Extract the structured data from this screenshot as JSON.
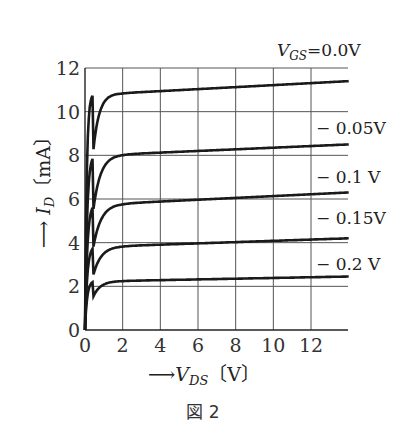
{
  "chart_data": {
    "type": "line",
    "title": "",
    "xlabel": "V_DS [V]",
    "ylabel": "I_D [mA]",
    "xlim": [
      0,
      14
    ],
    "ylim": [
      0,
      12
    ],
    "x_ticks": [
      0,
      2,
      4,
      6,
      8,
      10,
      12
    ],
    "y_ticks": [
      0,
      2,
      4,
      6,
      8,
      10,
      12
    ],
    "grid": true,
    "legend_position": "inline-right",
    "series": [
      {
        "name": "V_GS = 0.0V",
        "label": "VGS = 0.0V",
        "x": [
          0,
          0.3,
          0.5,
          1,
          2,
          4,
          8,
          14
        ],
        "values": [
          0,
          8.5,
          10.0,
          10.6,
          10.85,
          10.95,
          11.1,
          11.4
        ]
      },
      {
        "name": "-0.05V",
        "label": "− 0.05V",
        "x": [
          0,
          0.3,
          0.5,
          1,
          2,
          4,
          8,
          14
        ],
        "values": [
          0,
          6.0,
          7.4,
          7.9,
          8.05,
          8.1,
          8.25,
          8.5
        ]
      },
      {
        "name": "-0.1 V",
        "label": "− 0.1  V",
        "x": [
          0,
          0.3,
          0.5,
          1,
          2,
          4,
          8,
          14
        ],
        "values": [
          0,
          4.5,
          5.2,
          5.6,
          5.8,
          5.9,
          6.05,
          6.3
        ]
      },
      {
        "name": "-0.15V",
        "label": "− 0.15V",
        "x": [
          0,
          0.2,
          0.5,
          1,
          2,
          4,
          8,
          14
        ],
        "values": [
          0,
          2.5,
          3.3,
          3.7,
          3.85,
          3.95,
          4.05,
          4.2
        ]
      },
      {
        "name": "-0.2 V",
        "label": "− 0.2  V",
        "x": [
          0,
          0.2,
          0.5,
          1,
          2,
          4,
          8,
          14
        ],
        "values": [
          0,
          1.3,
          1.9,
          2.2,
          2.25,
          2.3,
          2.35,
          2.45
        ]
      }
    ]
  },
  "labels": {
    "y_axis_arrow": "→",
    "y_axis_label_var": "I",
    "y_axis_label_sub": "D",
    "y_axis_label_unit": "〔mA〕",
    "x_axis_arrow": "→",
    "x_axis_label_var": "V",
    "x_axis_label_sub": "DS",
    "x_axis_label_unit": "〔V〕",
    "vgs_prefix": "V",
    "vgs_sub": "GS",
    "figure_caption": "図 2"
  }
}
